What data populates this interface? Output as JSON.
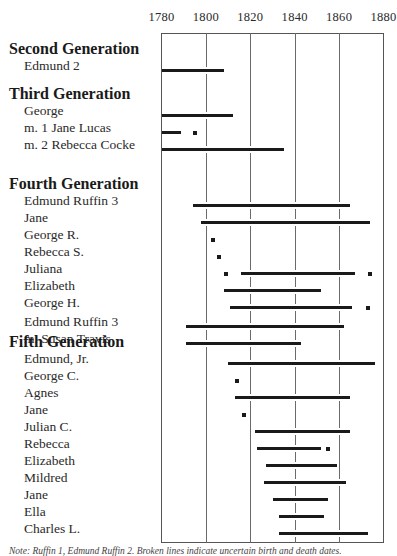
{
  "chart_data": {
    "type": "timeline",
    "title": "",
    "xlabel": "Year",
    "xlim": [
      1780,
      1880
    ],
    "ticks": [
      1780,
      1800,
      1820,
      1840,
      1860,
      1880
    ],
    "grid": true,
    "groups": [
      {
        "heading": "Second Generation",
        "rows": [
          {
            "label": "Edmund 2",
            "bars": [
              [
                1780,
                1808
              ]
            ],
            "dots": []
          }
        ]
      },
      {
        "heading": "Third Generation",
        "rows": [
          {
            "label": "George",
            "bars": [
              [
                1780,
                1812
              ]
            ],
            "dots": []
          },
          {
            "label": "m. 1 Jane Lucas",
            "bars": [
              [
                1780,
                1789
              ]
            ],
            "dots": [
              1795
            ]
          },
          {
            "label": "m. 2 Rebecca Cocke",
            "bars": [
              [
                1780,
                1835
              ]
            ],
            "dots": []
          }
        ]
      },
      {
        "heading": "Fourth Generation",
        "rows": [
          {
            "label": "Edmund Ruffin 3",
            "bars": [
              [
                1794,
                1865
              ]
            ],
            "dots": []
          },
          {
            "label": "Jane",
            "bars": [
              [
                1798,
                1874
              ]
            ],
            "dots": []
          },
          {
            "label": "George R.",
            "bars": [],
            "dots": [
              1803
            ]
          },
          {
            "label": "Rebecca S.",
            "bars": [],
            "dots": [
              1806
            ]
          },
          {
            "label": "Juliana",
            "bars": [
              [
                1816,
                1867
              ]
            ],
            "dots": [
              1809,
              1874
            ]
          },
          {
            "label": "Elizabeth",
            "bars": [
              [
                1808,
                1852
              ]
            ],
            "dots": []
          },
          {
            "label": "George H.",
            "bars": [
              [
                1811,
                1866
              ]
            ],
            "dots": [
              1873
            ]
          },
          {
            "label": "Edmund Ruffin 3",
            "bars": [
              [
                1791,
                1862
              ]
            ],
            "dots": [],
            "gap_before": true
          },
          {
            "label": "m. Susan Travis",
            "bars": [
              [
                1791,
                1843
              ]
            ],
            "dots": []
          }
        ]
      },
      {
        "heading": "Fifth Generation",
        "rows": [
          {
            "label": "Edmund, Jr.",
            "bars": [
              [
                1810,
                1876
              ]
            ],
            "dots": []
          },
          {
            "label": "George C.",
            "bars": [],
            "dots": [
              1814
            ]
          },
          {
            "label": "Agnes",
            "bars": [
              [
                1813,
                1865
              ]
            ],
            "dots": []
          },
          {
            "label": "Jane",
            "bars": [],
            "dots": [
              1817
            ]
          },
          {
            "label": "Julian C.",
            "bars": [
              [
                1822,
                1865
              ]
            ],
            "dots": []
          },
          {
            "label": "Rebecca",
            "bars": [
              [
                1823,
                1852
              ]
            ],
            "dots": [
              1855
            ]
          },
          {
            "label": "Elizabeth",
            "bars": [
              [
                1827,
                1859
              ]
            ],
            "dots": []
          },
          {
            "label": "Mildred",
            "bars": [
              [
                1826,
                1863
              ]
            ],
            "dots": []
          },
          {
            "label": "Jane",
            "bars": [
              [
                1830,
                1855
              ]
            ],
            "dots": []
          },
          {
            "label": "Ella",
            "bars": [
              [
                1833,
                1853
              ]
            ],
            "dots": []
          },
          {
            "label": "Charles L.",
            "bars": [
              [
                1833,
                1873
              ]
            ],
            "dots": []
          }
        ]
      }
    ]
  },
  "caption": "Note: Ruffin 1, Edmund Ruffin 2. Broken lines indicate uncertain birth and death dates."
}
